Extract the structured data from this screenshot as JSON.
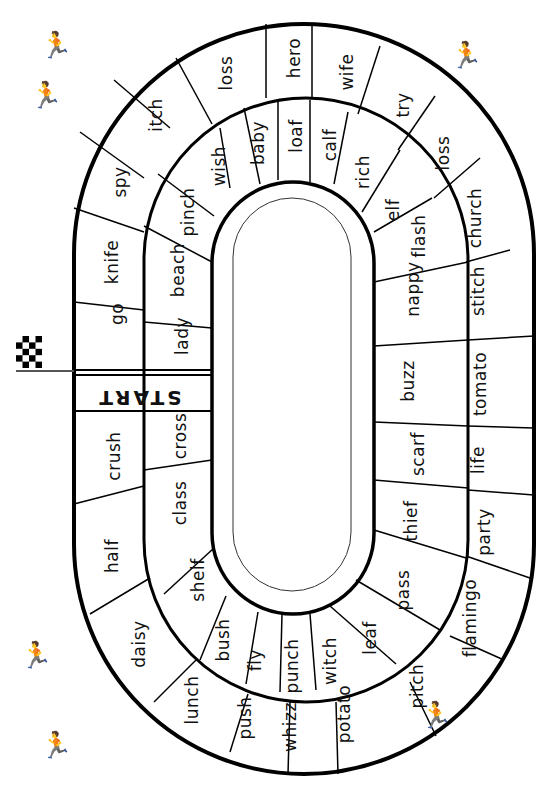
{
  "board": {
    "start_label": "START",
    "outer_lane": [
      {
        "word": "go",
        "x": 117,
        "y": 314
      },
      {
        "word": "knife",
        "x": 112,
        "y": 262
      },
      {
        "word": "spy",
        "x": 120,
        "y": 182
      },
      {
        "word": "itch",
        "x": 156,
        "y": 115
      },
      {
        "word": "loss",
        "x": 226,
        "y": 73
      },
      {
        "word": "hero",
        "x": 294,
        "y": 58
      },
      {
        "word": "wife",
        "x": 347,
        "y": 72
      },
      {
        "word": "try",
        "x": 403,
        "y": 105
      },
      {
        "word": "loss",
        "x": 443,
        "y": 153
      },
      {
        "word": "church",
        "x": 475,
        "y": 218
      },
      {
        "word": "stitch",
        "x": 478,
        "y": 291
      },
      {
        "word": "tomato",
        "x": 480,
        "y": 384
      },
      {
        "word": "life",
        "x": 478,
        "y": 460
      },
      {
        "word": "party",
        "x": 484,
        "y": 532
      },
      {
        "word": "flamingo",
        "x": 470,
        "y": 618
      },
      {
        "word": "pitch",
        "x": 417,
        "y": 686
      },
      {
        "word": "potato",
        "x": 344,
        "y": 714
      },
      {
        "word": "whizz",
        "x": 290,
        "y": 727
      },
      {
        "word": "push",
        "x": 245,
        "y": 718
      },
      {
        "word": "lunch",
        "x": 192,
        "y": 700
      },
      {
        "word": "daisy",
        "x": 139,
        "y": 644
      },
      {
        "word": "half",
        "x": 112,
        "y": 556
      },
      {
        "word": "crush",
        "x": 114,
        "y": 456
      }
    ],
    "inner_lane": [
      {
        "word": "lady",
        "x": 182,
        "y": 336
      },
      {
        "word": "beach",
        "x": 178,
        "y": 270
      },
      {
        "word": "pinch",
        "x": 188,
        "y": 212
      },
      {
        "word": "wish",
        "x": 219,
        "y": 166
      },
      {
        "word": "baby",
        "x": 258,
        "y": 143
      },
      {
        "word": "loaf",
        "x": 296,
        "y": 136
      },
      {
        "word": "calf",
        "x": 330,
        "y": 145
      },
      {
        "word": "rich",
        "x": 363,
        "y": 172
      },
      {
        "word": "elf",
        "x": 393,
        "y": 210
      },
      {
        "word": "flash",
        "x": 419,
        "y": 236
      },
      {
        "word": "nappy",
        "x": 413,
        "y": 289
      },
      {
        "word": "buzz",
        "x": 408,
        "y": 381
      },
      {
        "word": "scarf",
        "x": 418,
        "y": 454
      },
      {
        "word": "thief",
        "x": 411,
        "y": 521
      },
      {
        "word": "pass",
        "x": 403,
        "y": 590
      },
      {
        "word": "leaf",
        "x": 370,
        "y": 638
      },
      {
        "word": "witch",
        "x": 330,
        "y": 661
      },
      {
        "word": "punch",
        "x": 292,
        "y": 666
      },
      {
        "word": "fly",
        "x": 255,
        "y": 660
      },
      {
        "word": "bush",
        "x": 223,
        "y": 640
      },
      {
        "word": "shelf",
        "x": 198,
        "y": 580
      },
      {
        "word": "class",
        "x": 180,
        "y": 503
      },
      {
        "word": "cross",
        "x": 180,
        "y": 436
      }
    ]
  },
  "decorations": {
    "flag_icon": "checkered-flag",
    "runners": [
      {
        "name": "runner-top-left",
        "glyph": "🏃",
        "x": 40,
        "y": 30
      },
      {
        "name": "runner-top-left-2",
        "glyph": "🏃",
        "x": 30,
        "y": 80
      },
      {
        "name": "runners-top-right",
        "glyph": "🏃",
        "x": 450,
        "y": 40
      },
      {
        "name": "runner-bottom-left",
        "glyph": "🏃",
        "x": 20,
        "y": 640
      },
      {
        "name": "runner-bottom-left-2",
        "glyph": "🏃",
        "x": 40,
        "y": 730
      },
      {
        "name": "runners-bottom-right",
        "glyph": "🏃",
        "x": 420,
        "y": 700
      }
    ]
  }
}
